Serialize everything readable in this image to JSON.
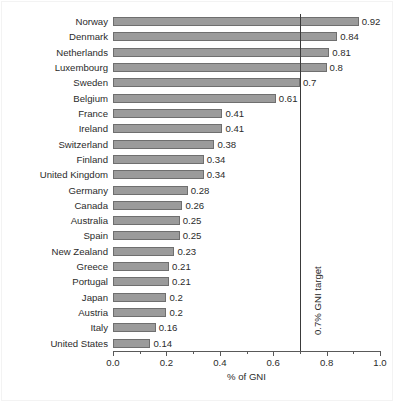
{
  "chart_data": {
    "type": "bar",
    "orientation": "horizontal",
    "title": "",
    "xlabel": "% of GNI",
    "ylabel": "",
    "xlim": [
      0.0,
      1.0
    ],
    "grid": false,
    "legend": null,
    "categories": [
      "Norway",
      "Denmark",
      "Netherlands",
      "Luxembourg",
      "Sweden",
      "Belgium",
      "France",
      "Ireland",
      "Switzerland",
      "Finland",
      "United Kingdom",
      "Germany",
      "Canada",
      "Australia",
      "Spain",
      "New Zealand",
      "Greece",
      "Portugal",
      "Japan",
      "Austria",
      "Italy",
      "United States"
    ],
    "values": [
      0.92,
      0.84,
      0.81,
      0.8,
      0.7,
      0.61,
      0.41,
      0.41,
      0.38,
      0.34,
      0.34,
      0.28,
      0.26,
      0.25,
      0.25,
      0.23,
      0.21,
      0.21,
      0.2,
      0.2,
      0.16,
      0.14
    ],
    "value_labels": [
      "0.92",
      "0.84",
      "0.81",
      "0.8",
      "0.7",
      "0.61",
      "0.41",
      "0.41",
      "0.38",
      "0.34",
      "0.34",
      "0.28",
      "0.26",
      "0.25",
      "0.25",
      "0.23",
      "0.21",
      "0.21",
      "0.2",
      "0.2",
      "0.16",
      "0.14"
    ],
    "x_ticks_major": [
      0.0,
      0.2,
      0.4,
      0.6,
      0.8,
      1.0
    ],
    "x_tick_labels": [
      "0.0",
      "0.2",
      "0.4",
      "0.6",
      "0.8",
      "1.0"
    ],
    "x_ticks_minor": [
      0.1,
      0.3,
      0.5,
      0.7,
      0.9
    ],
    "annotations": [
      {
        "name": "gni-target-line",
        "label": "0.7% GNI target",
        "value": 0.7,
        "orientation": "vertical"
      }
    ],
    "colors": {
      "bar_fill": "#9b9b9b",
      "bar_stroke": "#6f6f6f",
      "axis": "#595959",
      "target_line": "#3a3a3a",
      "text": "#2b2b2b",
      "background": "#ffffff"
    }
  }
}
